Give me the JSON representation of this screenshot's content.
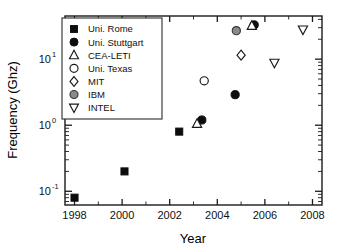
{
  "chart_data": {
    "type": "scatter",
    "title": "",
    "xlabel": "Year",
    "ylabel": "Frequency (Ghz)",
    "xlim": [
      1997.6,
      2008.4
    ],
    "ylim": [
      0.062,
      45
    ],
    "yscale": "log",
    "xscale": "linear",
    "grid": false,
    "legend_position": "upper-left-inside",
    "xticks": [
      1998,
      2000,
      2002,
      2004,
      2006,
      2008
    ],
    "xticklabels": [
      "1998",
      "2000",
      "2002",
      "2004",
      "2006",
      "2008"
    ],
    "yticks": [
      0.1,
      1,
      10
    ],
    "yticklabels": [
      "10-1",
      "100",
      "101"
    ],
    "ytick_bases": [
      "10",
      "10",
      "10"
    ],
    "ytick_exponents": [
      "-1",
      "0",
      "1"
    ],
    "series": [
      {
        "name": "Uni. Rome",
        "marker": "square",
        "fill": "#0d0d0d",
        "style": "filled",
        "points": [
          {
            "x": 1998.0,
            "y": 0.08
          },
          {
            "x": 2000.1,
            "y": 0.2
          },
          {
            "x": 2002.4,
            "y": 0.8
          }
        ]
      },
      {
        "name": "Uni. Stuttgart",
        "marker": "circle",
        "fill": "#0d0d0d",
        "style": "filled",
        "points": [
          {
            "x": 2003.35,
            "y": 1.2
          },
          {
            "x": 2004.75,
            "y": 2.9
          },
          {
            "x": 2005.55,
            "y": 33.0
          }
        ]
      },
      {
        "name": "CEA-LETI",
        "marker": "triangle-up",
        "fill": "#ffffff",
        "style": "open",
        "points": [
          {
            "x": 2003.15,
            "y": 1.05
          },
          {
            "x": 2005.45,
            "y": 32.0
          }
        ]
      },
      {
        "name": "Uni. Texas",
        "marker": "circle",
        "fill": "#ffffff",
        "style": "open",
        "points": [
          {
            "x": 2003.45,
            "y": 4.7
          }
        ]
      },
      {
        "name": "MIT",
        "marker": "diamond",
        "fill": "#ffffff",
        "style": "open",
        "points": [
          {
            "x": 2005.0,
            "y": 11.5
          }
        ]
      },
      {
        "name": "IBM",
        "marker": "circle",
        "fill": "#8a8a8a",
        "style": "gray",
        "points": [
          {
            "x": 2004.8,
            "y": 27.0
          }
        ]
      },
      {
        "name": "INTEL",
        "marker": "triangle-down",
        "fill": "#ffffff",
        "style": "open",
        "points": [
          {
            "x": 2006.4,
            "y": 8.8
          },
          {
            "x": 2007.6,
            "y": 28.0
          }
        ]
      }
    ]
  },
  "legend": {
    "entries": [
      {
        "label": "Uni. Rome",
        "marker": "square",
        "style": "filled"
      },
      {
        "label": "Uni. Stuttgart",
        "marker": "circle",
        "style": "filled"
      },
      {
        "label": "CEA-LETI",
        "marker": "triangle-up",
        "style": "open"
      },
      {
        "label": "Uni. Texas",
        "marker": "circle",
        "style": "open"
      },
      {
        "label": "MIT",
        "marker": "diamond",
        "style": "open"
      },
      {
        "label": "IBM",
        "marker": "circle",
        "style": "gray"
      },
      {
        "label": "INTEL",
        "marker": "triangle-down",
        "style": "open"
      }
    ]
  },
  "colors": {
    "filled": "#0d0d0d",
    "open_stroke": "#1a1a1a",
    "open_fill": "#ffffff",
    "gray_fill": "#8a8a8a",
    "gray_stroke": "#3a3a3a",
    "axis": "#1a1a1a",
    "background": "#ffffff"
  }
}
